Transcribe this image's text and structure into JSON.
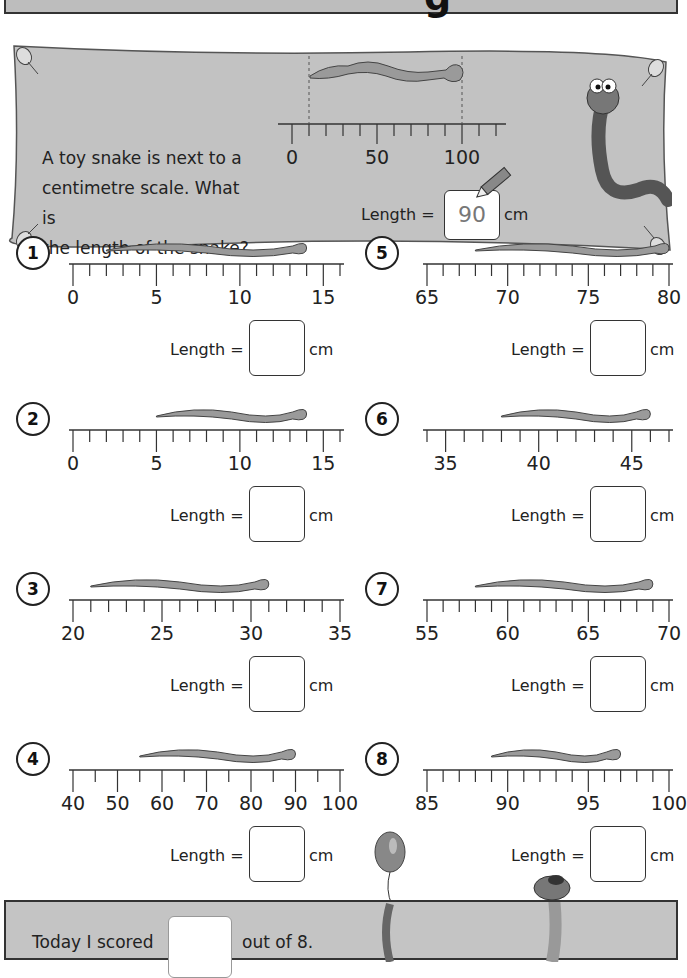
{
  "header": {
    "title_visible_fragment": "g"
  },
  "example": {
    "question": "A toy snake is next to a centimetre scale.  What is the length of the snake?",
    "question_lines": [
      "A toy snake is next to a",
      "centimetre scale.  What is",
      "the length of the snake?"
    ],
    "scale_labels": [
      "0",
      "50",
      "100"
    ],
    "scale": {
      "min": 0,
      "max": 120,
      "tick_step": 10,
      "labeled": [
        0,
        50,
        100
      ]
    },
    "snake": {
      "start": 10,
      "end": 100
    },
    "length_label": "Length =",
    "answer": "90",
    "unit": "cm"
  },
  "questions": [
    {
      "number": "1",
      "labels": [
        "0",
        "5",
        "10",
        "15"
      ],
      "min": 0,
      "max": 16,
      "step": 1,
      "snake": {
        "start": 2,
        "end": 14
      },
      "length_label": "Length =",
      "answer": "",
      "unit": "cm"
    },
    {
      "number": "2",
      "labels": [
        "0",
        "5",
        "10",
        "15"
      ],
      "min": 0,
      "max": 16,
      "step": 1,
      "snake": {
        "start": 5,
        "end": 14
      },
      "length_label": "Length =",
      "answer": "",
      "unit": "cm"
    },
    {
      "number": "3",
      "labels": [
        "20",
        "25",
        "30",
        "35"
      ],
      "min": 20,
      "max": 35,
      "step": 1,
      "snake": {
        "start": 21,
        "end": 31
      },
      "length_label": "Length =",
      "answer": "",
      "unit": "cm"
    },
    {
      "number": "4",
      "labels": [
        "40",
        "50",
        "60",
        "70",
        "80",
        "90",
        "100"
      ],
      "min": 40,
      "max": 100,
      "step": 5,
      "snake": {
        "start": 55,
        "end": 90
      },
      "length_label": "Length =",
      "answer": "",
      "unit": "cm"
    },
    {
      "number": "5",
      "labels": [
        "65",
        "70",
        "75",
        "80"
      ],
      "min": 65,
      "max": 80,
      "step": 1,
      "snake": {
        "start": 68,
        "end": 80
      },
      "length_label": "Length =",
      "answer": "",
      "unit": "cm"
    },
    {
      "number": "6",
      "labels": [
        "35",
        "40",
        "45"
      ],
      "min": 34,
      "max": 47,
      "step": 1,
      "snake": {
        "start": 38,
        "end": 46
      },
      "length_label": "Length =",
      "answer": "",
      "unit": "cm"
    },
    {
      "number": "7",
      "labels": [
        "55",
        "60",
        "65",
        "70"
      ],
      "min": 55,
      "max": 70,
      "step": 1,
      "snake": {
        "start": 58,
        "end": 69
      },
      "length_label": "Length =",
      "answer": "",
      "unit": "cm"
    },
    {
      "number": "8",
      "labels": [
        "85",
        "90",
        "95",
        "100"
      ],
      "min": 85,
      "max": 100,
      "step": 1,
      "snake": {
        "start": 89,
        "end": 97
      },
      "length_label": "Length =",
      "answer": "",
      "unit": "cm"
    }
  ],
  "footer": {
    "prefix": "Today I scored",
    "suffix": "out of 8.",
    "score": ""
  },
  "colors": {
    "banner": "#c2c2c2",
    "footer": "#c4c4c4",
    "snake": "#9a9a9a",
    "outline": "#333333"
  }
}
